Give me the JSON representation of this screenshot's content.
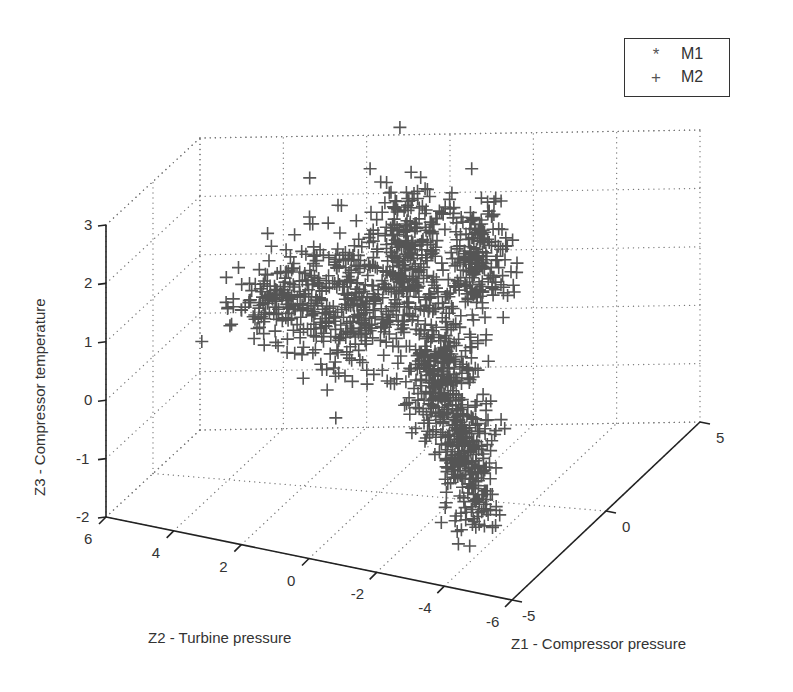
{
  "chart_data": {
    "type": "scatter3d",
    "title": "",
    "xlabel": "Z1 - Compressor pressure",
    "ylabel": "Z2 - Turbine pressure",
    "zlabel": "Z3 - Compressor temperature",
    "xlim": [
      -5,
      5
    ],
    "ylim": [
      -6,
      6
    ],
    "zlim": [
      -2,
      3
    ],
    "x_ticks": [
      "-5",
      "0",
      "5"
    ],
    "y_ticks": [
      "6",
      "4",
      "2",
      "0",
      "-2",
      "-4",
      "-6"
    ],
    "z_ticks": [
      "3",
      "2",
      "1",
      "0",
      "-1",
      "-2"
    ],
    "grid": true,
    "legend_position": "northeast",
    "series": [
      {
        "name": "M1",
        "marker": "*",
        "visible_points": 0
      },
      {
        "name": "M2",
        "marker": "+",
        "color": "#555555",
        "description": "Dense cluster (~1500 points) shaped like an inverted Y: two upper lobes near Z3≈1.5–3, a left arm toward Z2≈5, Z3≈1–2, and a tail descending to Z3≈-2 near Z2≈-3..-4",
        "clusters": [
          {
            "cx": 355,
            "cy": 300,
            "sx": 55,
            "sy": 45,
            "n": 420
          },
          {
            "cx": 410,
            "cy": 240,
            "sx": 22,
            "sy": 35,
            "n": 180
          },
          {
            "cx": 475,
            "cy": 260,
            "sx": 22,
            "sy": 40,
            "n": 200
          },
          {
            "cx": 280,
            "cy": 300,
            "sx": 30,
            "sy": 22,
            "n": 120
          },
          {
            "cx": 440,
            "cy": 370,
            "sx": 22,
            "sy": 35,
            "n": 250
          },
          {
            "cx": 462,
            "cy": 440,
            "sx": 18,
            "sy": 35,
            "n": 200
          },
          {
            "cx": 475,
            "cy": 500,
            "sx": 14,
            "sy": 22,
            "n": 70
          }
        ]
      }
    ]
  },
  "legend": {
    "items": [
      {
        "marker": "*",
        "label": "M1"
      },
      {
        "marker": "+",
        "label": "M2"
      }
    ]
  },
  "colors": {
    "axis": "#222222",
    "grid": "#777777",
    "marker": "#555555"
  }
}
